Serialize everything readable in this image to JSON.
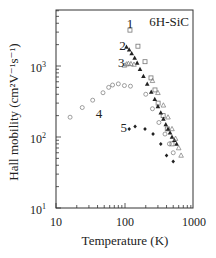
{
  "chart_data": {
    "type": "scatter",
    "title": "6H-SiC",
    "xlabel": "Temperature (K)",
    "ylabel": "Hall mobility (cm²V⁻¹s⁻¹)",
    "xscale": "log",
    "yscale": "log",
    "xlim": [
      10,
      1000
    ],
    "ylim": [
      10,
      6000
    ],
    "xticks": [
      "10",
      "100",
      "1000"
    ],
    "yticks": [
      "10¹",
      "10²",
      "10³"
    ],
    "grid": false,
    "legend": "inline numeric labels",
    "series": [
      {
        "name": "1",
        "marker": "open-square",
        "label_pos": [
          118,
          3900
        ],
        "x": [
          118,
          154,
          195,
          238,
          272,
          302,
          357,
          410,
          480
        ],
        "y": [
          3200,
          1900,
          1150,
          680,
          460,
          300,
          200,
          130,
          80
        ]
      },
      {
        "name": "2",
        "marker": "filled-triangle",
        "label_pos": [
          92,
          1900
        ],
        "x": [
          105,
          115,
          125,
          138,
          150,
          165,
          185,
          210,
          240,
          270,
          300,
          330,
          360,
          390,
          420,
          450,
          480,
          520,
          560
        ],
        "y": [
          1850,
          1700,
          1500,
          1300,
          1100,
          900,
          720,
          560,
          430,
          340,
          270,
          220,
          180,
          150,
          130,
          115,
          100,
          90,
          80
        ]
      },
      {
        "name": "3",
        "marker": "open-triangle",
        "label_pos": [
          88,
          1100
        ],
        "x": [
          98,
          105,
          112,
          122,
          135,
          250,
          300,
          360,
          420,
          480,
          540,
          600,
          650
        ],
        "y": [
          1020,
          1060,
          1080,
          1070,
          1050,
          620,
          420,
          280,
          190,
          130,
          95,
          70,
          55
        ]
      },
      {
        "name": "4",
        "marker": "open-circle",
        "label_pos": [
          42,
          210
        ],
        "x": [
          16,
          24,
          34,
          48,
          58,
          66,
          80,
          98,
          120,
          200,
          250,
          310,
          380,
          440,
          500
        ],
        "y": [
          190,
          260,
          330,
          420,
          500,
          540,
          560,
          530,
          520,
          400,
          250,
          160,
          110,
          80,
          60
        ]
      },
      {
        "name": "5",
        "marker": "filled-diamond",
        "label_pos": [
          96,
          135
        ],
        "x": [
          115,
          140,
          195,
          255,
          330,
          400,
          500
        ],
        "y": [
          130,
          140,
          130,
          110,
          80,
          55,
          45
        ]
      }
    ]
  },
  "panel": {
    "title": "6H-SiC",
    "xlabel": "Temperature (K)",
    "ylabel": "Hall mobility (cm²V⁻¹s⁻¹)",
    "xtick_labels": [
      "10",
      "100",
      "1000"
    ],
    "ytick_labels": [
      {
        "base": "10",
        "exp": "1"
      },
      {
        "base": "10",
        "exp": "2"
      },
      {
        "base": "10",
        "exp": "3"
      }
    ]
  }
}
